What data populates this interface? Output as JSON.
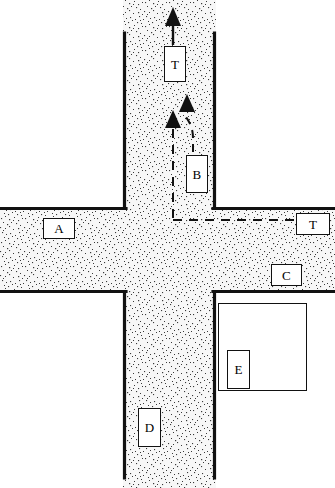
{
  "diagram": {
    "type": "road-intersection-schematic",
    "colors": {
      "road_fill": "#f2f2f2",
      "road_stipple": "#2b2b2b",
      "line": "#111111",
      "background": "#ffffff",
      "label_text": "#000000"
    },
    "roads": {
      "vertical": {
        "name": "vertical-road",
        "left_edge_x": 123,
        "right_edge_x": 216,
        "top_y": 33,
        "bottom_y": 478
      },
      "horizontal": {
        "name": "horizontal-road",
        "top_edge_y": 207,
        "bottom_edge_y": 293,
        "left_x": 0,
        "right_x": 335
      }
    },
    "labels": [
      {
        "id": "label-t-top",
        "text": "T",
        "x": 164,
        "y": 46,
        "width": 22,
        "height": 36
      },
      {
        "id": "label-b",
        "text": "B",
        "x": 186,
        "y": 155,
        "width": 22,
        "height": 38
      },
      {
        "id": "label-a",
        "text": "A",
        "x": 43,
        "y": 218,
        "width": 32,
        "height": 21
      },
      {
        "id": "label-t-right",
        "text": "T",
        "x": 296,
        "y": 213,
        "width": 34,
        "height": 22
      },
      {
        "id": "label-c",
        "text": "C",
        "x": 271,
        "y": 264,
        "width": 31,
        "height": 22
      },
      {
        "id": "label-e",
        "text": "E",
        "x": 227,
        "y": 350,
        "width": 23,
        "height": 39
      },
      {
        "id": "label-d",
        "text": "D",
        "x": 138,
        "y": 408,
        "width": 23,
        "height": 39
      }
    ],
    "buildings": [
      {
        "id": "building-e-outer",
        "x": 218,
        "y": 303,
        "width": 89,
        "height": 88
      }
    ],
    "arrows": [
      {
        "id": "arrow-exit-top",
        "direction": "up",
        "tip_x": 173,
        "tip_y": 8,
        "tail_y": 45
      },
      {
        "id": "arrow-vehicle-b-path",
        "direction": "up",
        "tip_x": 187,
        "tip_y": 94
      },
      {
        "id": "arrow-vehicle-t-path",
        "direction": "up",
        "tip_x": 173,
        "tip_y": 110
      }
    ],
    "dashed_paths": [
      {
        "id": "dashed-path-t-vertical",
        "description": "vertical dashed line from T arrowhead down to horizontal dashed segment"
      },
      {
        "id": "dashed-path-t-horizontal",
        "description": "horizontal dashed line running right to the T label box"
      },
      {
        "id": "dashed-path-b-curve",
        "description": "curved dashed line from B label up and left toward the B arrowhead"
      }
    ]
  }
}
